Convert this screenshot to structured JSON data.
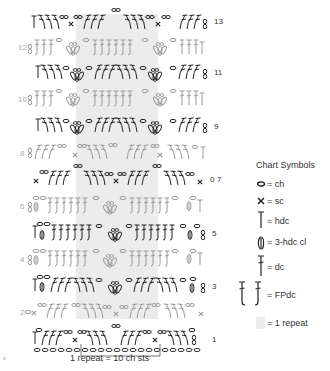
{
  "chart": {
    "repeat_band_color": "#ececec",
    "stitch_dark_color": "#222222",
    "stitch_light_color": "#9a9a9a",
    "rows": [
      {
        "number": "13",
        "side": "right",
        "tone": "dark"
      },
      {
        "number": "12",
        "side": "left",
        "tone": "light"
      },
      {
        "number": "11",
        "side": "right",
        "tone": "dark"
      },
      {
        "number": "10",
        "side": "left",
        "tone": "light"
      },
      {
        "number": "9",
        "side": "right",
        "tone": "dark"
      },
      {
        "number": "8",
        "side": "left",
        "tone": "light"
      },
      {
        "number": "7",
        "side": "right",
        "tone": "dark"
      },
      {
        "number": "6",
        "side": "left",
        "tone": "light"
      },
      {
        "number": "5",
        "side": "right",
        "tone": "dark"
      },
      {
        "number": "4",
        "side": "left",
        "tone": "light"
      },
      {
        "number": "3",
        "side": "right",
        "tone": "dark"
      },
      {
        "number": "2",
        "side": "left",
        "tone": "light"
      },
      {
        "number": "1",
        "side": "right",
        "tone": "dark"
      }
    ],
    "row7_marker": "0",
    "repeat_caption": "1 repeat = 10 ch sts",
    "corner_mark": "‹"
  },
  "legend": {
    "title": "Chart Symbols",
    "items": [
      {
        "symbol": "chain-icon",
        "label": "= ch"
      },
      {
        "symbol": "single-crochet-icon",
        "label": "= sc"
      },
      {
        "symbol": "half-double-crochet-icon",
        "label": "= hdc"
      },
      {
        "symbol": "cluster-icon",
        "label": "= 3-hdc cl"
      },
      {
        "symbol": "double-crochet-icon",
        "label": "= dc"
      },
      {
        "symbol": "front-post-dc-icon",
        "label": "= FPdc"
      },
      {
        "symbol": "repeat-swatch",
        "label": "= 1 repeat"
      }
    ]
  }
}
